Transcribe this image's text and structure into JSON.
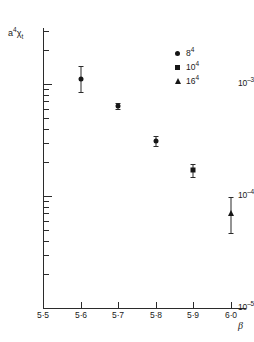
{
  "chart_data": {
    "type": "scatter",
    "title": "",
    "xlabel": "β",
    "ylabel": "a⁴χₜ",
    "xlim": [
      5.5,
      6.0
    ],
    "ylim": [
      1e-05,
      0.00316
    ],
    "yscale": "log",
    "xscale": "linear",
    "grid": false,
    "legend_position": "top-right",
    "x_ticks": [
      "5·5",
      "5·6",
      "5·7",
      "5·8",
      "5·9",
      "6·0"
    ],
    "x_tick_values": [
      5.5,
      5.6,
      5.7,
      5.8,
      5.9,
      6.0
    ],
    "y_ticks": [
      "10⁻³",
      "10⁻⁴",
      "10⁻⁵"
    ],
    "y_tick_values": [
      0.001,
      0.0001,
      1e-05
    ],
    "series": [
      {
        "name": "8⁴",
        "marker": "circle",
        "points": [
          {
            "x": 5.6,
            "y": 0.0011,
            "yerr_low": 0.00026,
            "yerr_high": 0.00034
          },
          {
            "x": 5.7,
            "y": 0.00064,
            "yerr_low": 4e-05,
            "yerr_high": 4e-05
          },
          {
            "x": 5.8,
            "y": 0.00031,
            "yerr_low": 3e-05,
            "yerr_high": 3e-05
          }
        ]
      },
      {
        "name": "10⁴",
        "marker": "square",
        "points": [
          {
            "x": 5.9,
            "y": 0.00017,
            "yerr_low": 2.2e-05,
            "yerr_high": 2.2e-05
          }
        ]
      },
      {
        "name": "16⁴",
        "marker": "triangle",
        "points": [
          {
            "x": 6.0,
            "y": 7e-05,
            "yerr_low": 2.3e-05,
            "yerr_high": 2.8e-05
          }
        ]
      }
    ]
  },
  "axes": {
    "y_title_base": "a",
    "y_title_sup": "4",
    "y_title_chi": "χ",
    "y_title_sub": "t",
    "x_title": "β",
    "y_tick_labels": [
      {
        "mantissa": "10",
        "exp": "–3",
        "value": 0.001
      },
      {
        "mantissa": "10",
        "exp": "–4",
        "value": 0.0001
      },
      {
        "mantissa": "10",
        "exp": "–5",
        "value": 1e-05
      }
    ],
    "x_tick_labels": [
      "5·5",
      "5·6",
      "5·7",
      "5·8",
      "5·9",
      "6·0"
    ]
  },
  "legend": {
    "entries": [
      {
        "marker": "circle",
        "label": "8",
        "exp": "4"
      },
      {
        "marker": "square",
        "label": "10",
        "exp": "4"
      },
      {
        "marker": "triangle",
        "label": "16",
        "exp": "4"
      }
    ]
  },
  "colors": {
    "background": "#ffffff",
    "axis": "#2b2b2b",
    "marker": "#161616",
    "text": "#1a1a1a"
  }
}
